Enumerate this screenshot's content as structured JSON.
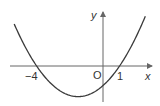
{
  "diagram": {
    "type": "parabola-graph",
    "equation_implied": "y = (x + 4)(x - 1)",
    "axes": {
      "x_label": "x",
      "y_label": "y",
      "origin_label": "O"
    },
    "x_intercepts": [
      {
        "value": -4,
        "label": "−4"
      },
      {
        "value": 1,
        "label": "1"
      }
    ],
    "colors": {
      "curve": "#3a3a3a",
      "axes": "#666666"
    }
  }
}
